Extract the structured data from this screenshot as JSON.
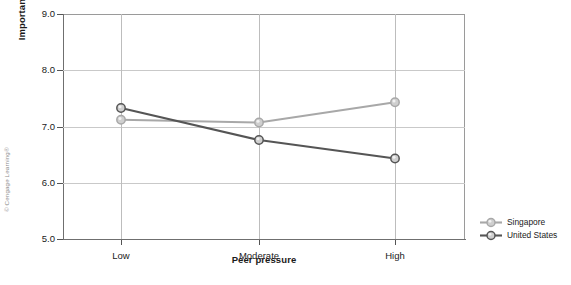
{
  "figure": {
    "copyright": "© Cengage Learning®"
  },
  "chart_data": {
    "type": "line",
    "title": "",
    "xlabel": "Peer pressure",
    "ylabel": "Importance of disposition",
    "categories": [
      "Low",
      "Moderate",
      "High"
    ],
    "ylim": [
      5.0,
      9.0
    ],
    "yticks": [
      "5.0",
      "6.0",
      "7.0",
      "8.0",
      "9.0"
    ],
    "ytick_values": [
      5.0,
      6.0,
      7.0,
      8.0,
      9.0
    ],
    "grid": "horizontal-and-vertical",
    "legend_position": "right",
    "series": [
      {
        "name": "Singapore",
        "color": "#a8a8a8",
        "marker": "circle",
        "values": [
          7.12,
          7.07,
          7.43
        ]
      },
      {
        "name": "United States",
        "color": "#555555",
        "marker": "circle",
        "values": [
          7.33,
          6.76,
          6.43
        ]
      }
    ]
  },
  "axis": {
    "y_ticks": [
      {
        "label": "9.0",
        "value": 9.0
      },
      {
        "label": "8.0",
        "value": 8.0
      },
      {
        "label": "7.0",
        "value": 7.0
      },
      {
        "label": "6.0",
        "value": 6.0
      },
      {
        "label": "5.0",
        "value": 5.0
      }
    ],
    "x_ticks": [
      {
        "label": "Low"
      },
      {
        "label": "Moderate"
      },
      {
        "label": "High"
      }
    ]
  },
  "legend": {
    "items": [
      {
        "label": "Singapore",
        "color": "#a8a8a8"
      },
      {
        "label": "United States",
        "color": "#555555"
      }
    ]
  }
}
